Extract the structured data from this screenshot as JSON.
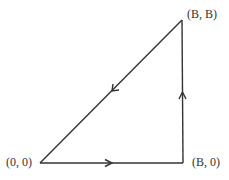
{
  "diagram": {
    "type": "triangle-contour",
    "vertices": [
      {
        "id": "origin",
        "label": "(0, 0)"
      },
      {
        "id": "b0",
        "label": "(B, 0)"
      },
      {
        "id": "bb",
        "label": "(B, B)"
      }
    ],
    "edges": [
      {
        "from": "(0, 0)",
        "to": "(B, 0)",
        "direction": "right"
      },
      {
        "from": "(B, 0)",
        "to": "(B, B)",
        "direction": "up"
      },
      {
        "from": "(B, B)",
        "to": "(0, 0)",
        "direction": "down-left"
      }
    ],
    "colors": {
      "line": "#333333",
      "background": "#ffffff"
    }
  }
}
